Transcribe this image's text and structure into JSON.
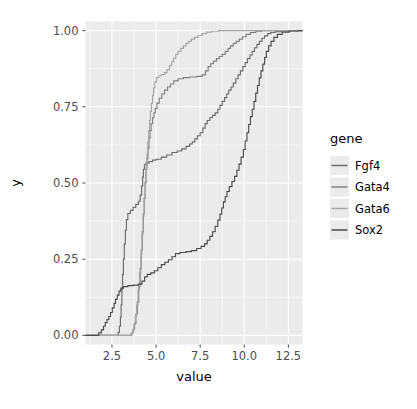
{
  "chart_data": {
    "type": "line",
    "subtype": "ecdf-step",
    "title": "",
    "xlabel": "value",
    "ylabel": "y",
    "xlim": [
      1.0,
      13.3
    ],
    "ylim": [
      -0.03,
      1.03
    ],
    "xticks": [
      2.5,
      5.0,
      7.5,
      10.0,
      12.5
    ],
    "xticklabels": [
      "2.5",
      "5.0",
      "7.5",
      "10.0",
      "12.5"
    ],
    "yticks": [
      0.0,
      0.25,
      0.5,
      0.75,
      1.0
    ],
    "yticklabels": [
      "0.00",
      "0.25",
      "0.50",
      "0.75",
      "1.00"
    ],
    "x_minor_ticks": [
      1.25,
      3.75,
      6.25,
      8.75,
      11.25
    ],
    "y_minor_ticks": [
      0.125,
      0.375,
      0.625,
      0.875
    ],
    "grid": true,
    "grid_color": "#ffffff",
    "panel_background": "#ebebeb",
    "legend": {
      "title": "gene",
      "position": "right",
      "entries": [
        {
          "name": "Fgf4",
          "color": "#6b6b6b"
        },
        {
          "name": "Gata4",
          "color": "#808080"
        },
        {
          "name": "Gata6",
          "color": "#a6a6a6"
        },
        {
          "name": "Sox2",
          "color": "#4a4a4a"
        }
      ]
    },
    "series": [
      {
        "name": "Fgf4",
        "color": "#6b6b6b",
        "points": [
          [
            1.0,
            0.0
          ],
          [
            2.8,
            0.0
          ],
          [
            2.85,
            0.01
          ],
          [
            2.92,
            0.03
          ],
          [
            2.98,
            0.06
          ],
          [
            3.02,
            0.1
          ],
          [
            3.06,
            0.15
          ],
          [
            3.1,
            0.2
          ],
          [
            3.15,
            0.25
          ],
          [
            3.2,
            0.3
          ],
          [
            3.26,
            0.345
          ],
          [
            3.32,
            0.38
          ],
          [
            3.4,
            0.4
          ],
          [
            3.55,
            0.41
          ],
          [
            3.7,
            0.42
          ],
          [
            3.85,
            0.43
          ],
          [
            4.0,
            0.44
          ],
          [
            4.1,
            0.46
          ],
          [
            4.18,
            0.49
          ],
          [
            4.24,
            0.52
          ],
          [
            4.28,
            0.545
          ],
          [
            4.34,
            0.56
          ],
          [
            4.42,
            0.565
          ],
          [
            4.6,
            0.57
          ],
          [
            4.8,
            0.575
          ],
          [
            5.0,
            0.578
          ],
          [
            5.3,
            0.585
          ],
          [
            5.6,
            0.592
          ],
          [
            5.9,
            0.6
          ],
          [
            6.2,
            0.605
          ],
          [
            6.45,
            0.612
          ],
          [
            6.7,
            0.62
          ],
          [
            6.9,
            0.628
          ],
          [
            7.05,
            0.635
          ],
          [
            7.2,
            0.645
          ],
          [
            7.35,
            0.655
          ],
          [
            7.5,
            0.665
          ],
          [
            7.65,
            0.68
          ],
          [
            7.78,
            0.695
          ],
          [
            7.9,
            0.705
          ],
          [
            8.05,
            0.715
          ],
          [
            8.2,
            0.722
          ],
          [
            8.35,
            0.73
          ],
          [
            8.5,
            0.742
          ],
          [
            8.62,
            0.755
          ],
          [
            8.75,
            0.768
          ],
          [
            8.88,
            0.78
          ],
          [
            9.0,
            0.792
          ],
          [
            9.12,
            0.805
          ],
          [
            9.25,
            0.815
          ],
          [
            9.38,
            0.828
          ],
          [
            9.52,
            0.842
          ],
          [
            9.65,
            0.855
          ],
          [
            9.78,
            0.868
          ],
          [
            9.92,
            0.882
          ],
          [
            10.05,
            0.895
          ],
          [
            10.18,
            0.908
          ],
          [
            10.32,
            0.92
          ],
          [
            10.45,
            0.932
          ],
          [
            10.58,
            0.944
          ],
          [
            10.72,
            0.955
          ],
          [
            10.86,
            0.965
          ],
          [
            11.0,
            0.975
          ],
          [
            11.15,
            0.983
          ],
          [
            11.32,
            0.99
          ],
          [
            11.5,
            0.994
          ],
          [
            11.75,
            0.997
          ],
          [
            12.1,
            0.999
          ],
          [
            12.6,
            1.0
          ],
          [
            13.3,
            1.0
          ]
        ]
      },
      {
        "name": "Gata4",
        "color": "#808080",
        "points": [
          [
            1.0,
            0.0
          ],
          [
            3.55,
            0.0
          ],
          [
            3.62,
            0.008
          ],
          [
            3.7,
            0.02
          ],
          [
            3.78,
            0.04
          ],
          [
            3.86,
            0.07
          ],
          [
            3.94,
            0.11
          ],
          [
            4.02,
            0.16
          ],
          [
            4.1,
            0.22
          ],
          [
            4.16,
            0.28
          ],
          [
            4.22,
            0.34
          ],
          [
            4.28,
            0.4
          ],
          [
            4.33,
            0.45
          ],
          [
            4.38,
            0.5
          ],
          [
            4.43,
            0.545
          ],
          [
            4.48,
            0.58
          ],
          [
            4.54,
            0.615
          ],
          [
            4.6,
            0.648
          ],
          [
            4.66,
            0.672
          ],
          [
            4.72,
            0.695
          ],
          [
            4.8,
            0.715
          ],
          [
            4.88,
            0.73
          ],
          [
            4.96,
            0.745
          ],
          [
            5.05,
            0.762
          ],
          [
            5.18,
            0.778
          ],
          [
            5.32,
            0.792
          ],
          [
            5.48,
            0.805
          ],
          [
            5.65,
            0.815
          ],
          [
            5.82,
            0.825
          ],
          [
            6.0,
            0.835
          ],
          [
            6.25,
            0.842
          ],
          [
            6.55,
            0.846
          ],
          [
            6.9,
            0.848
          ],
          [
            7.3,
            0.85
          ],
          [
            7.6,
            0.855
          ],
          [
            7.8,
            0.868
          ],
          [
            7.95,
            0.882
          ],
          [
            8.1,
            0.892
          ],
          [
            8.25,
            0.9
          ],
          [
            8.42,
            0.908
          ],
          [
            8.58,
            0.915
          ],
          [
            8.75,
            0.922
          ],
          [
            8.92,
            0.932
          ],
          [
            9.08,
            0.942
          ],
          [
            9.22,
            0.95
          ],
          [
            9.38,
            0.958
          ],
          [
            9.55,
            0.965
          ],
          [
            9.72,
            0.972
          ],
          [
            9.9,
            0.98
          ],
          [
            10.1,
            0.988
          ],
          [
            10.35,
            0.994
          ],
          [
            10.65,
            0.998
          ],
          [
            11.0,
            1.0
          ],
          [
            13.3,
            1.0
          ]
        ]
      },
      {
        "name": "Gata6",
        "color": "#a6a6a6",
        "points": [
          [
            1.0,
            0.0
          ],
          [
            3.5,
            0.0
          ],
          [
            3.58,
            0.006
          ],
          [
            3.66,
            0.016
          ],
          [
            3.74,
            0.035
          ],
          [
            3.82,
            0.062
          ],
          [
            3.9,
            0.1
          ],
          [
            3.98,
            0.148
          ],
          [
            4.06,
            0.205
          ],
          [
            4.14,
            0.268
          ],
          [
            4.2,
            0.33
          ],
          [
            4.26,
            0.392
          ],
          [
            4.32,
            0.45
          ],
          [
            4.38,
            0.505
          ],
          [
            4.43,
            0.552
          ],
          [
            4.48,
            0.595
          ],
          [
            4.53,
            0.635
          ],
          [
            4.58,
            0.672
          ],
          [
            4.63,
            0.705
          ],
          [
            4.68,
            0.735
          ],
          [
            4.74,
            0.762
          ],
          [
            4.8,
            0.788
          ],
          [
            4.86,
            0.812
          ],
          [
            4.93,
            0.832
          ],
          [
            5.02,
            0.846
          ],
          [
            5.15,
            0.852
          ],
          [
            5.3,
            0.856
          ],
          [
            5.48,
            0.862
          ],
          [
            5.62,
            0.872
          ],
          [
            5.76,
            0.885
          ],
          [
            5.88,
            0.898
          ],
          [
            6.0,
            0.91
          ],
          [
            6.12,
            0.922
          ],
          [
            6.25,
            0.932
          ],
          [
            6.4,
            0.942
          ],
          [
            6.55,
            0.95
          ],
          [
            6.7,
            0.958
          ],
          [
            6.85,
            0.965
          ],
          [
            7.0,
            0.972
          ],
          [
            7.18,
            0.978
          ],
          [
            7.38,
            0.984
          ],
          [
            7.6,
            0.99
          ],
          [
            7.85,
            0.995
          ],
          [
            8.15,
            0.998
          ],
          [
            8.55,
            1.0
          ],
          [
            13.3,
            1.0
          ]
        ]
      },
      {
        "name": "Sox2",
        "color": "#4a4a4a",
        "points": [
          [
            1.0,
            0.0
          ],
          [
            1.6,
            0.0
          ],
          [
            1.75,
            0.008
          ],
          [
            1.9,
            0.018
          ],
          [
            2.02,
            0.03
          ],
          [
            2.12,
            0.042
          ],
          [
            2.22,
            0.052
          ],
          [
            2.32,
            0.062
          ],
          [
            2.42,
            0.075
          ],
          [
            2.52,
            0.09
          ],
          [
            2.62,
            0.105
          ],
          [
            2.7,
            0.118
          ],
          [
            2.8,
            0.132
          ],
          [
            2.9,
            0.145
          ],
          [
            3.0,
            0.155
          ],
          [
            3.15,
            0.16
          ],
          [
            3.4,
            0.163
          ],
          [
            3.7,
            0.165
          ],
          [
            4.0,
            0.168
          ],
          [
            4.2,
            0.178
          ],
          [
            4.35,
            0.192
          ],
          [
            4.5,
            0.2
          ],
          [
            4.7,
            0.205
          ],
          [
            4.9,
            0.212
          ],
          [
            5.1,
            0.222
          ],
          [
            5.3,
            0.232
          ],
          [
            5.5,
            0.24
          ],
          [
            5.7,
            0.248
          ],
          [
            5.9,
            0.258
          ],
          [
            6.1,
            0.268
          ],
          [
            6.35,
            0.272
          ],
          [
            6.7,
            0.275
          ],
          [
            7.0,
            0.278
          ],
          [
            7.3,
            0.285
          ],
          [
            7.55,
            0.292
          ],
          [
            7.75,
            0.3
          ],
          [
            7.9,
            0.312
          ],
          [
            8.05,
            0.325
          ],
          [
            8.2,
            0.34
          ],
          [
            8.35,
            0.358
          ],
          [
            8.5,
            0.378
          ],
          [
            8.62,
            0.398
          ],
          [
            8.72,
            0.418
          ],
          [
            8.82,
            0.438
          ],
          [
            8.92,
            0.455
          ],
          [
            9.02,
            0.472
          ],
          [
            9.15,
            0.488
          ],
          [
            9.3,
            0.505
          ],
          [
            9.45,
            0.522
          ],
          [
            9.58,
            0.542
          ],
          [
            9.7,
            0.562
          ],
          [
            9.82,
            0.585
          ],
          [
            9.95,
            0.61
          ],
          [
            10.05,
            0.638
          ],
          [
            10.15,
            0.665
          ],
          [
            10.25,
            0.692
          ],
          [
            10.35,
            0.718
          ],
          [
            10.45,
            0.742
          ],
          [
            10.55,
            0.768
          ],
          [
            10.65,
            0.795
          ],
          [
            10.75,
            0.82
          ],
          [
            10.85,
            0.845
          ],
          [
            10.95,
            0.868
          ],
          [
            11.05,
            0.89
          ],
          [
            11.15,
            0.912
          ],
          [
            11.25,
            0.932
          ],
          [
            11.38,
            0.95
          ],
          [
            11.52,
            0.965
          ],
          [
            11.68,
            0.978
          ],
          [
            11.88,
            0.988
          ],
          [
            12.15,
            0.995
          ],
          [
            12.55,
            0.999
          ],
          [
            13.05,
            1.0
          ],
          [
            13.3,
            1.0
          ]
        ]
      }
    ]
  }
}
